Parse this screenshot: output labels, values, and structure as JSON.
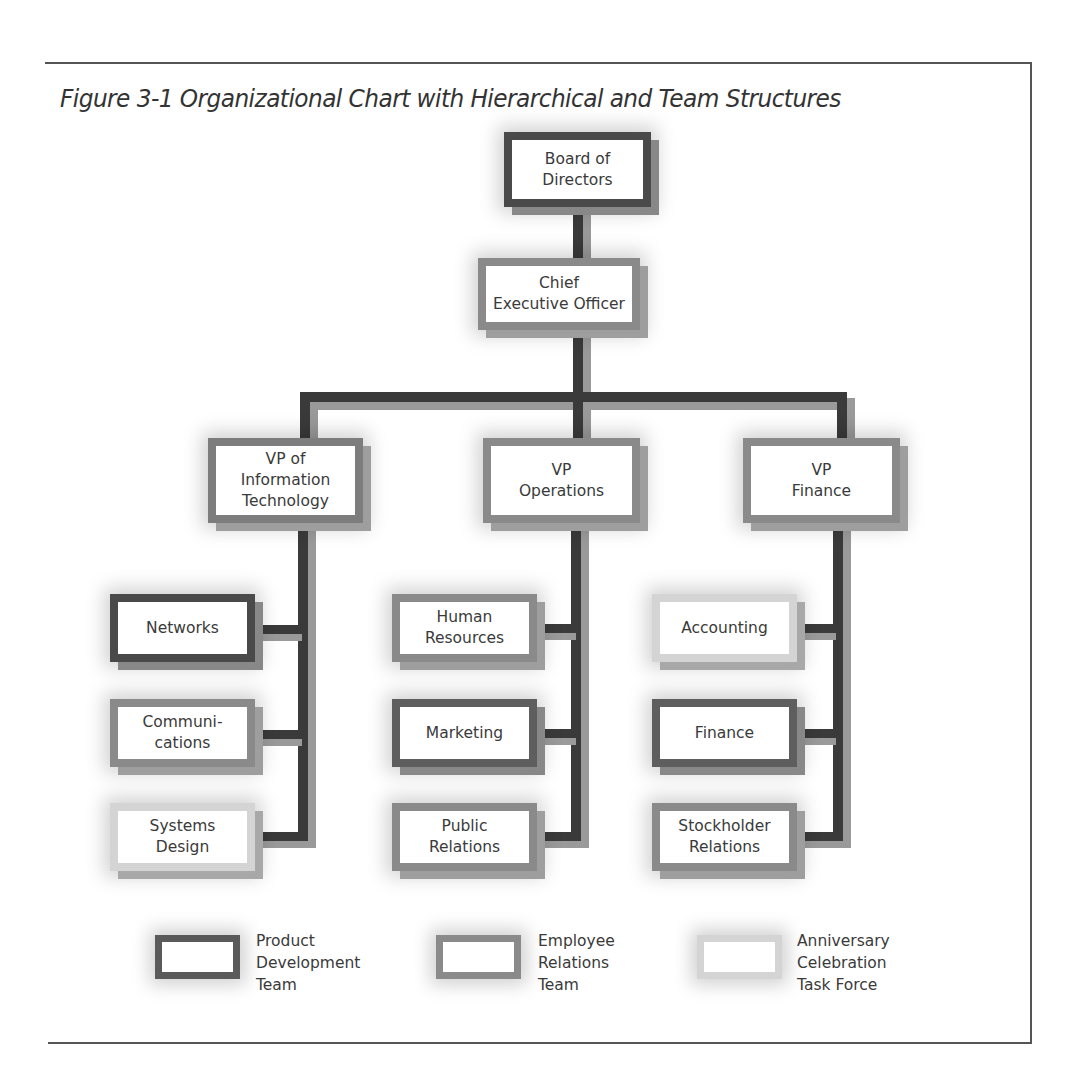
{
  "figure": {
    "title": "Figure 3-1  Organizational Chart with Hierarchical and Team Structures"
  },
  "colors": {
    "product_development_team": "#4a4a4a",
    "employee_relations_team": "#8a8a8a",
    "anniversary_celebration_task_force": "#d4d4d4",
    "connector": "#3a3a3a"
  },
  "nodes": {
    "board": {
      "label": "Board of\nDirectors",
      "team": "product_development_team"
    },
    "ceo": {
      "label": "Chief\nExecutive Officer",
      "team": "employee_relations_team"
    },
    "vp_it": {
      "label": "VP of\nInformation\nTechnology",
      "team": "employee_relations_team"
    },
    "vp_ops": {
      "label": "VP\nOperations",
      "team": "employee_relations_team"
    },
    "vp_fin": {
      "label": "VP\nFinance",
      "team": "employee_relations_team"
    },
    "networks": {
      "label": "Networks",
      "team": "product_development_team"
    },
    "communications": {
      "label": "Communi-\ncations",
      "team": "employee_relations_team"
    },
    "systems_design": {
      "label": "Systems\nDesign",
      "team": "anniversary_celebration_task_force"
    },
    "human_resources": {
      "label": "Human\nResources",
      "team": "employee_relations_team"
    },
    "marketing": {
      "label": "Marketing",
      "team": "product_development_team"
    },
    "public_relations": {
      "label": "Public\nRelations",
      "team": "employee_relations_team"
    },
    "accounting": {
      "label": "Accounting",
      "team": "anniversary_celebration_task_force"
    },
    "finance": {
      "label": "Finance",
      "team": "product_development_team"
    },
    "stockholder_relations": {
      "label": "Stockholder\nRelations",
      "team": "employee_relations_team"
    }
  },
  "hierarchy": {
    "board": [
      "ceo"
    ],
    "ceo": [
      "vp_it",
      "vp_ops",
      "vp_fin"
    ],
    "vp_it": [
      "networks",
      "communications",
      "systems_design"
    ],
    "vp_ops": [
      "human_resources",
      "marketing",
      "public_relations"
    ],
    "vp_fin": [
      "accounting",
      "finance",
      "stockholder_relations"
    ]
  },
  "legend": [
    {
      "label": "Product\nDevelopment\nTeam",
      "key": "product_development_team"
    },
    {
      "label": "Employee\nRelations\nTeam",
      "key": "employee_relations_team"
    },
    {
      "label": "Anniversary\nCelebration\nTask Force",
      "key": "anniversary_celebration_task_force"
    }
  ]
}
